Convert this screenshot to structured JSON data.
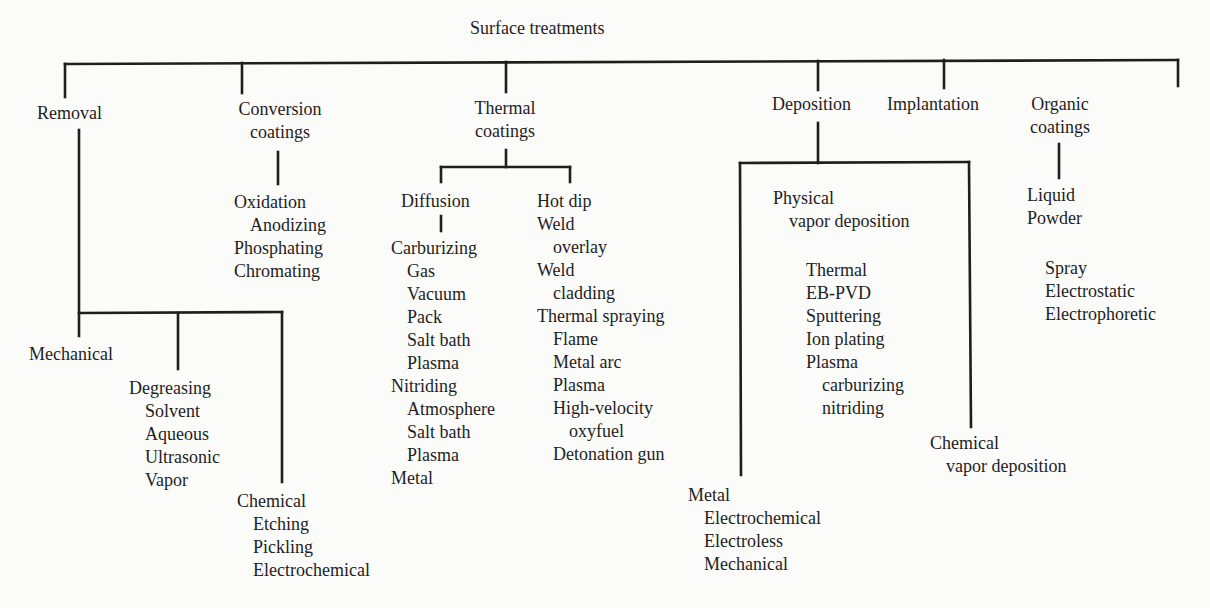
{
  "root": "Surface treatments",
  "categories": {
    "removal": {
      "label": "Removal",
      "mechanical": "Mechanical",
      "degreasing": {
        "label": "Degreasing",
        "items": [
          "Solvent",
          "Aqueous",
          "Ultrasonic",
          "Vapor"
        ]
      },
      "chemical": {
        "label": "Chemical",
        "items": [
          "Etching",
          "Pickling",
          "Electrochemical"
        ]
      }
    },
    "conversion": {
      "label_line1": "Conversion",
      "label_line2": "coatings",
      "items": [
        "Oxidation",
        "Anodizing",
        "Phosphating",
        "Chromating"
      ]
    },
    "thermal": {
      "label_line1": "Thermal",
      "label_line2": "coatings",
      "diffusion": {
        "label": "Diffusion",
        "carburizing": {
          "label": "Carburizing",
          "items": [
            "Gas",
            "Vacuum",
            "Pack",
            "Salt bath",
            "Plasma"
          ]
        },
        "nitriding": {
          "label": "Nitriding",
          "items": [
            "Atmosphere",
            "Salt bath",
            "Plasma"
          ]
        },
        "metal": "Metal"
      },
      "other": {
        "hot_dip": "Hot dip",
        "weld_overlay": [
          "Weld",
          "overlay"
        ],
        "weld_cladding": [
          "Weld",
          "cladding"
        ],
        "thermal_spraying": {
          "label": "Thermal spraying",
          "items": [
            "Flame",
            "Metal arc",
            "Plasma",
            "High-velocity",
            "oxyfuel",
            "Detonation gun"
          ]
        }
      }
    },
    "deposition": {
      "label": "Deposition",
      "pvd": {
        "label_line1": "Physical",
        "label_line2": "vapor deposition",
        "items": [
          "Thermal",
          "EB-PVD",
          "Sputtering",
          "Ion plating",
          "Plasma"
        ],
        "plasma_sub": [
          "carburizing",
          "nitriding"
        ]
      },
      "cvd": {
        "label_line1": "Chemical",
        "label_line2": "vapor deposition"
      },
      "metal": {
        "label": "Metal",
        "items": [
          "Electrochemical",
          "Electroless",
          "Mechanical"
        ]
      }
    },
    "implantation": {
      "label": "Implantation"
    },
    "organic": {
      "label_line1": "Organic",
      "label_line2": "coatings",
      "forms": [
        "Liquid",
        "Powder"
      ],
      "methods": [
        "Spray",
        "Electrostatic",
        "Electrophoretic"
      ]
    }
  }
}
